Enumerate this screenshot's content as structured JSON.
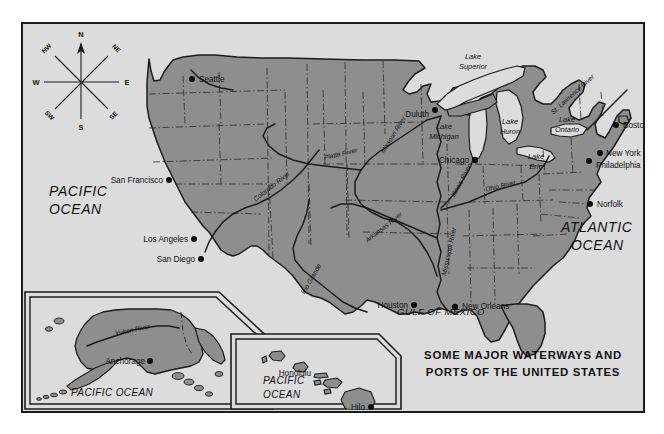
{
  "map": {
    "title_line1": "SOME MAJOR WATERWAYS AND",
    "title_line2": "PORTS OF THE UNITED STATES",
    "colors": {
      "land": "#8e8e8e",
      "water": "#dcdcdc",
      "outline": "#1c1c1c",
      "frame": "#1c1c1c",
      "text": "#111111"
    },
    "compass": {
      "n": "N",
      "ne": "NE",
      "e": "E",
      "se": "SE",
      "s": "S",
      "sw": "SW",
      "w": "W",
      "nw": "NW"
    },
    "oceans": [
      {
        "id": "pacific-west",
        "line1": "PACIFIC",
        "line2": "OCEAN"
      },
      {
        "id": "atlantic",
        "line1": "ATLANTIC",
        "line2": "OCEAN"
      },
      {
        "id": "gulf",
        "line1": "GULF OF MEXICO"
      },
      {
        "id": "pacific-alaska",
        "line1": "PACIFIC OCEAN"
      },
      {
        "id": "pacific-hawaii",
        "line1": "PACIFIC",
        "line2": "OCEAN"
      }
    ],
    "cities": [
      {
        "name": "Seattle",
        "x": 172,
        "y": 55,
        "anchor": "start",
        "dx": 6,
        "dy": 3
      },
      {
        "name": "San Francisco",
        "x": 143,
        "y": 156,
        "anchor": "end",
        "dx": -6,
        "dy": 3
      },
      {
        "name": "Los Angeles",
        "x": 168,
        "y": 215,
        "anchor": "end",
        "dx": -6,
        "dy": 3
      },
      {
        "name": "San Diego",
        "x": 175,
        "y": 235,
        "anchor": "end",
        "dx": -6,
        "dy": 3
      },
      {
        "name": "Duluth",
        "x": 409,
        "y": 88,
        "anchor": "end",
        "dx": -5,
        "dy": 4
      },
      {
        "name": "Chicago",
        "x": 450,
        "y": 139,
        "anchor": "end",
        "dx": -5,
        "dy": 3
      },
      {
        "name": "Boston",
        "x": 596,
        "y": 103,
        "anchor": "start",
        "dx": 6,
        "dy": 3
      },
      {
        "name": "New York",
        "x": 580,
        "y": 132,
        "anchor": "start",
        "dx": 5,
        "dy": 3
      },
      {
        "name": "Philadelphia",
        "x": 569,
        "y": 142,
        "anchor": "start",
        "dx": 6,
        "dy": 7
      },
      {
        "name": "Norfolk",
        "x": 570,
        "y": 182,
        "anchor": "start",
        "dx": 6,
        "dy": 3
      },
      {
        "name": "Houston",
        "x": 388,
        "y": 283,
        "anchor": "end",
        "dx": -5,
        "dy": 3
      },
      {
        "name": "New Orleans",
        "x": 435,
        "y": 283,
        "anchor": "start",
        "dx": 5,
        "dy": 2
      },
      {
        "name": "Anchorage",
        "x": 124,
        "y": 337,
        "anchor": "end",
        "dx": -5,
        "dy": 2
      },
      {
        "name": "Honolulu",
        "x": 290,
        "y": 349,
        "anchor": "end",
        "dx": 0,
        "dy": 0
      },
      {
        "name": "Hilo",
        "x": 342,
        "y": 383,
        "anchor": "end",
        "dx": -5,
        "dy": 3
      }
    ],
    "lakes": [
      {
        "name": "Lake Superior",
        "line1": "Lake",
        "line2": "Superior",
        "x": 474,
        "y": 52
      },
      {
        "name": "Lake Michigan",
        "line1": "Lake",
        "line2": "Michigan",
        "x": 450,
        "y": 115
      },
      {
        "name": "Lake Huron",
        "line1": "Lake",
        "line2": "Huron",
        "x": 493,
        "y": 105
      },
      {
        "name": "Lake Erie",
        "line1": "Lake",
        "line2": "Erie",
        "x": 515,
        "y": 136
      },
      {
        "name": "Lake Ontario",
        "line1": "Lake",
        "line2": "Ontario",
        "x": 545,
        "y": 106
      }
    ],
    "rivers": [
      {
        "name": "St. Lawrence River",
        "x": 555,
        "y": 88,
        "rotate": -42
      },
      {
        "name": "Missouri River",
        "x": 372,
        "y": 112,
        "rotate": -58
      },
      {
        "name": "Platte River",
        "x": 345,
        "y": 140,
        "rotate": -15
      },
      {
        "name": "Colorado River",
        "x": 258,
        "y": 172,
        "rotate": -38
      },
      {
        "name": "Arkansas River",
        "x": 367,
        "y": 208,
        "rotate": -38
      },
      {
        "name": "Rio Grande",
        "x": 288,
        "y": 256,
        "rotate": -62
      },
      {
        "name": "Illinois River",
        "x": 441,
        "y": 157,
        "rotate": -64
      },
      {
        "name": "Ohio River",
        "x": 483,
        "y": 162,
        "rotate": -14
      },
      {
        "name": "Mississippi River",
        "x": 437,
        "y": 232,
        "rotate": -78
      },
      {
        "name": "Yukon River",
        "x": 112,
        "y": 308,
        "rotate": -12
      }
    ],
    "insets": [
      {
        "id": "alaska-inset",
        "label": "Alaska"
      },
      {
        "id": "hawaii-inset",
        "label": "Hawaii"
      }
    ]
  }
}
